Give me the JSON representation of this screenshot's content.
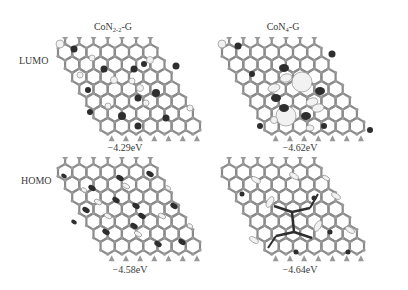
{
  "figure": {
    "columns": [
      {
        "id": "con22",
        "title_base": "CoN",
        "title_sub": "2-2",
        "title_suffix": "-G"
      },
      {
        "id": "con4",
        "title_base": "CoN",
        "title_sub": "4",
        "title_suffix": "-G"
      }
    ],
    "rows": [
      {
        "id": "lumo",
        "label": "LUMO"
      },
      {
        "id": "homo",
        "label": "HOMO"
      }
    ],
    "panels": [
      {
        "row": "lumo",
        "column": "con22",
        "energy": "−4.29eV"
      },
      {
        "row": "lumo",
        "column": "con4",
        "energy": "−4.62eV"
      },
      {
        "row": "homo",
        "column": "con22",
        "energy": "−4.58eV"
      },
      {
        "row": "homo",
        "column": "con4",
        "energy": "−4.64eV"
      }
    ],
    "colors": {
      "bond": "#8a8a8a",
      "atom": "#9a9a9a",
      "orbital_dark": "#2e2e2e",
      "orbital_light": "#f2f2f2",
      "orbital_light_edge": "#9c9c9c",
      "text": "#3a3a3a"
    }
  }
}
